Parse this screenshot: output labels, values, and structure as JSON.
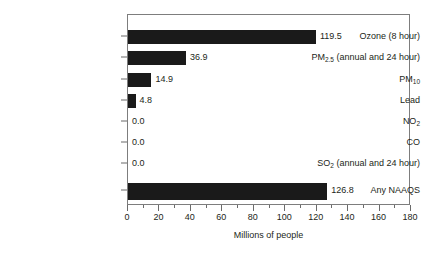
{
  "chart_data": {
    "type": "bar",
    "orientation": "horizontal",
    "title": "",
    "xlabel": "Millions of people",
    "ylabel": "",
    "xlim": [
      0,
      180
    ],
    "xticks": [
      0,
      20,
      40,
      60,
      80,
      100,
      120,
      140,
      160,
      180
    ],
    "xtick_labels": [
      "0",
      "20",
      "40",
      "60",
      "80",
      "100",
      "120",
      "140",
      "160",
      "180"
    ],
    "minor_tick_step": 10,
    "grid": false,
    "legend": null,
    "bar_color": "#1a1a1a",
    "frame_color": "#7d7d7d",
    "categories": [
      "Ozone  (8 hour)",
      "PM2.5 (annual and 24 hour)",
      "PM10",
      "Lead",
      "NO2",
      "CO",
      "SO2 (annual and 24 hour)",
      "Any NAAQS"
    ],
    "values": [
      119.5,
      36.9,
      14.9,
      4.8,
      0.0,
      0.0,
      0.0,
      126.8
    ],
    "bar_pixel_lengths": [
      145.0,
      73.5,
      13.5,
      5.5,
      0,
      0,
      0,
      159.0
    ],
    "data_labels": [
      "119.5",
      "36.9",
      "14.9",
      "4.8",
      "0.0",
      "0.0",
      "0.0",
      "126.8"
    ]
  },
  "axis": {
    "x_title": "Millions of people"
  },
  "rows": [
    {
      "label_html": "Ozone  (8 hour)",
      "label_main": "Ozone  (8 hour)",
      "label_sub": "",
      "label_tail": "",
      "value_label": "119.5"
    },
    {
      "label_html": "PM2.5 (annual and 24 hour)",
      "label_main": "PM",
      "label_sub": "2.5",
      "label_tail": " (annual and 24 hour)",
      "value_label": "36.9"
    },
    {
      "label_html": "PM10",
      "label_main": "PM",
      "label_sub": "10",
      "label_tail": "",
      "value_label": "14.9"
    },
    {
      "label_html": "Lead",
      "label_main": "Lead",
      "label_sub": "",
      "label_tail": "",
      "value_label": "4.8"
    },
    {
      "label_html": "NO2",
      "label_main": "NO",
      "label_sub": "2",
      "label_tail": "",
      "value_label": "0.0"
    },
    {
      "label_html": "CO",
      "label_main": "CO",
      "label_sub": "",
      "label_tail": "",
      "value_label": "0.0"
    },
    {
      "label_html": "SO2 (annual and 24 hour)",
      "label_main": "SO",
      "label_sub": "2",
      "label_tail": " (annual and 24 hour)",
      "value_label": "0.0"
    },
    {
      "label_html": "Any NAAQS",
      "label_main": "Any NAAQS",
      "label_sub": "",
      "label_tail": "",
      "value_label": "126.8"
    }
  ]
}
